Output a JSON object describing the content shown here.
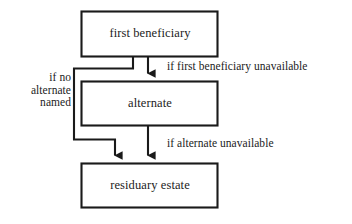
{
  "diagram": {
    "type": "flowchart",
    "style": {
      "background": "#ffffff",
      "stroke": "#1a1a1a",
      "text": "#1c1c1c",
      "stroke_width": 2
    },
    "nodes": [
      {
        "id": "first-beneficiary",
        "label": "first beneficiary",
        "shape": "rectangle",
        "x": 81,
        "y": 11,
        "width": 137,
        "height": 46
      },
      {
        "id": "alternate",
        "label": "alternate",
        "shape": "rectangle",
        "x": 81,
        "y": 81,
        "width": 137,
        "height": 45
      },
      {
        "id": "residuary-estate",
        "label": "residuary estate",
        "shape": "rectangle",
        "x": 81,
        "y": 163,
        "width": 137,
        "height": 45
      }
    ],
    "edges": [
      {
        "id": "first-to-alternate",
        "from": "first-beneficiary",
        "to": "alternate",
        "label": "if first beneficiary unavailable",
        "arrow": true
      },
      {
        "id": "first-to-residuary",
        "from": "first-beneficiary",
        "to": "residuary-estate",
        "label": "if no alternate named",
        "label_lines": [
          "if no",
          "alternate",
          "named"
        ],
        "arrow": true
      },
      {
        "id": "alternate-to-residuary",
        "from": "alternate",
        "to": "residuary-estate",
        "label": "if alternate unavailable",
        "arrow": true
      }
    ]
  }
}
